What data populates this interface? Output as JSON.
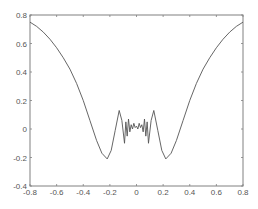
{
  "chart_data": {
    "type": "line",
    "title": "",
    "xlabel": "",
    "ylabel": "",
    "xlim": [
      -0.8,
      0.8
    ],
    "ylim": [
      -0.4,
      0.8
    ],
    "grid": false,
    "legend": null,
    "x_ticks": [
      "-0.8",
      "-0.6",
      "-0.4",
      "-0.2",
      "0",
      "0.2",
      "0.4",
      "0.6",
      "0.8"
    ],
    "y_ticks": [
      "0.8",
      "0.6",
      "0.4",
      "0.2",
      "0",
      "-0.2",
      "-0.4"
    ],
    "series": [
      {
        "name": "signal",
        "color": "#555555",
        "x": [
          -0.8,
          -0.75,
          -0.7,
          -0.65,
          -0.6,
          -0.55,
          -0.5,
          -0.45,
          -0.4,
          -0.35,
          -0.3,
          -0.26,
          -0.22,
          -0.19,
          -0.16,
          -0.13,
          -0.11,
          -0.09,
          -0.08,
          -0.07,
          -0.06,
          -0.05,
          -0.04,
          -0.03,
          -0.02,
          -0.01,
          0,
          0.01,
          0.02,
          0.03,
          0.04,
          0.05,
          0.06,
          0.07,
          0.08,
          0.09,
          0.11,
          0.13,
          0.16,
          0.19,
          0.22,
          0.26,
          0.3,
          0.35,
          0.4,
          0.45,
          0.5,
          0.55,
          0.6,
          0.65,
          0.7,
          0.75,
          0.8
        ],
        "y": [
          0.75,
          0.72,
          0.68,
          0.63,
          0.57,
          0.5,
          0.42,
          0.32,
          0.2,
          0.06,
          -0.08,
          -0.17,
          -0.21,
          -0.15,
          -0.01,
          0.13,
          0.06,
          -0.1,
          0.05,
          -0.05,
          0.07,
          -0.02,
          0.03,
          0.0,
          0.04,
          0.01,
          0.02,
          0.0,
          0.04,
          0.01,
          0.03,
          -0.02,
          0.07,
          -0.05,
          0.05,
          -0.1,
          0.06,
          0.13,
          -0.01,
          -0.15,
          -0.21,
          -0.17,
          -0.08,
          0.06,
          0.2,
          0.32,
          0.42,
          0.5,
          0.57,
          0.63,
          0.68,
          0.72,
          0.75
        ]
      }
    ]
  },
  "style": {
    "axis_color": "#808080",
    "line_color": "#555555",
    "label_color": "#555555"
  }
}
